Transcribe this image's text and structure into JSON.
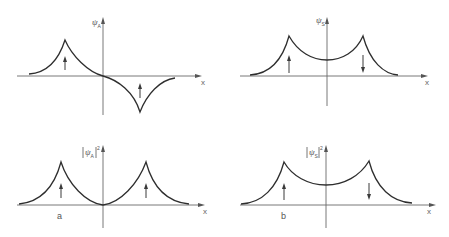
{
  "figure": {
    "panels": [
      {
        "id": "top-left",
        "y_label": "ψ",
        "y_label_sub": "A",
        "y_label_abs": false,
        "y_label_sup": "",
        "x_label": "x",
        "panel_label": "",
        "description": "Antisymmetric wavefunction: cusp peak at left site, cusp trough at right site, passes through zero at origin",
        "spins": [
          "up",
          "up"
        ]
      },
      {
        "id": "top-right",
        "y_label": "ψ",
        "y_label_sub": "S",
        "y_label_abs": false,
        "y_label_sup": "",
        "x_label": "x",
        "panel_label": "",
        "description": "Symmetric wavefunction: two cusp peaks, nonzero minimum at origin",
        "spins": [
          "up",
          "down"
        ]
      },
      {
        "id": "bottom-left",
        "y_label": "ψ",
        "y_label_sub": "A",
        "y_label_abs": true,
        "y_label_sup": "2",
        "x_label": "x",
        "panel_label": "a",
        "description": "Probability density of antisymmetric state: two cusp peaks, zero at origin",
        "spins": [
          "up",
          "up"
        ]
      },
      {
        "id": "bottom-right",
        "y_label": "ψ",
        "y_label_sub": "S",
        "y_label_abs": true,
        "y_label_sup": "2",
        "x_label": "x",
        "panel_label": "b",
        "description": "Probability density of symmetric state: two cusp peaks, nonzero minimum at origin",
        "spins": [
          "up",
          "down"
        ]
      }
    ]
  },
  "colors": {
    "curve": "#2e2e2e",
    "axis": "#6a6a6a",
    "text": "#555555",
    "background": "#ffffff"
  }
}
